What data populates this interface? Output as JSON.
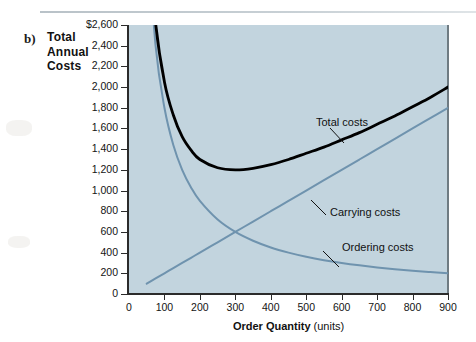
{
  "caption": {
    "letter": "b)",
    "title_line1": "Total",
    "title_line2": "Annual",
    "title_line3": "Costs"
  },
  "colors": {
    "plot_background": "#c2d4de",
    "total_costs": "#000000",
    "carrying_costs": "#6f93ae",
    "ordering_costs": "#6f93ae",
    "axis": "#2b2b2b",
    "page_background": "#ffffff"
  },
  "chart_data": {
    "type": "line",
    "title": "Total Annual Costs",
    "xlabel_bold": "Order Quantity",
    "xlabel_normal": "(units)",
    "ylabel": "Total Annual Costs",
    "xlim": [
      0,
      900
    ],
    "ylim": [
      0,
      2600
    ],
    "grid": false,
    "legend_position": "inline-annotations",
    "xticks": [
      "0",
      "100",
      "200",
      "300",
      "400",
      "500",
      "600",
      "700",
      "800",
      "900"
    ],
    "xtick_values": [
      0,
      100,
      200,
      300,
      400,
      500,
      600,
      700,
      800,
      900
    ],
    "yticks": [
      "0",
      "200",
      "400",
      "600",
      "800",
      "1,000",
      "1,200",
      "1,400",
      "1,600",
      "1,800",
      "2,000",
      "2,200",
      "2,400",
      "$2,600"
    ],
    "ytick_values": [
      0,
      200,
      400,
      600,
      800,
      1000,
      1200,
      1400,
      1600,
      1800,
      2000,
      2200,
      2400,
      2600
    ],
    "x": [
      50,
      75,
      100,
      125,
      150,
      175,
      200,
      250,
      300,
      350,
      400,
      450,
      500,
      550,
      600,
      650,
      700,
      750,
      800,
      850,
      900
    ],
    "series": [
      {
        "name": "Total costs",
        "color": "#000000",
        "values": [
          3700,
          2620,
          2050,
          1730,
          1520,
          1390,
          1300,
          1220,
          1200,
          1215,
          1250,
          1300,
          1360,
          1420,
          1490,
          1560,
          1640,
          1720,
          1810,
          1900,
          2000
        ]
      },
      {
        "name": "Carrying costs",
        "color": "#6f93ae",
        "values": [
          100,
          150,
          200,
          250,
          300,
          350,
          400,
          500,
          600,
          700,
          800,
          900,
          1000,
          1100,
          1200,
          1300,
          1400,
          1500,
          1600,
          1700,
          1800
        ]
      },
      {
        "name": "Ordering costs",
        "color": "#6f93ae",
        "values": [
          3600,
          2400,
          1800,
          1440,
          1200,
          1030,
          900,
          720,
          600,
          515,
          450,
          400,
          360,
          327,
          300,
          277,
          257,
          240,
          225,
          212,
          200
        ]
      }
    ],
    "annotations": [
      {
        "text": "Total costs",
        "x": 510,
        "y": 1700
      },
      {
        "text": "Carrying costs",
        "x": 560,
        "y": 900
      },
      {
        "text": "Ordering costs",
        "x": 640,
        "y": 470
      }
    ]
  }
}
